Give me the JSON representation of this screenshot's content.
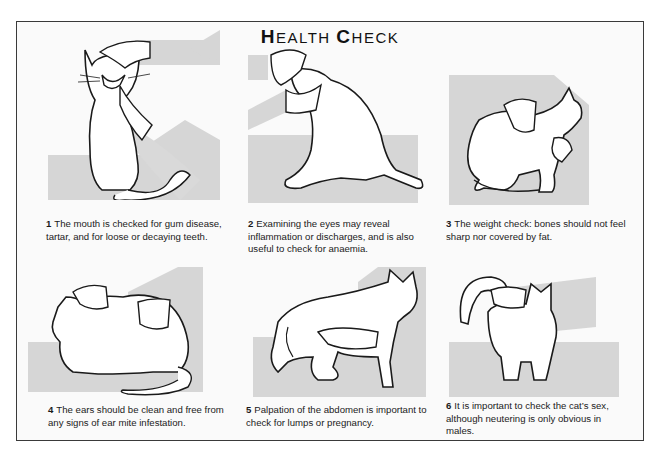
{
  "page": {
    "title": "HEALTH CHECK",
    "title_parts": {
      "h": "H",
      "ealth": "EALTH ",
      "c": "C",
      "heck": "HECK"
    },
    "accent_grey": "#d6d6d6",
    "line_color": "#1a1a1a"
  },
  "panels": [
    {
      "number": "1",
      "caption": "The mouth is checked for gum disease, tartar, and for loose or decaying teeth.",
      "illustration": "cat-sitting-mouth-open-hand-on-head"
    },
    {
      "number": "2",
      "caption": "Examining the eyes may reveal inflammation or discharges, and is also useful to check for anaemia.",
      "illustration": "cat-sitting-hand-holding-head"
    },
    {
      "number": "3",
      "caption": "The weight check: bones should not feel sharp nor covered by fat.",
      "illustration": "cat-crouching-hands-on-back-and-chest"
    },
    {
      "number": "4",
      "caption": "The ears should be clean and free from any signs of ear mite infestation.",
      "illustration": "cat-lying-hand-on-ear-and-back"
    },
    {
      "number": "5",
      "caption": "Palpation of the abdomen is important to check for lumps or pregnancy.",
      "illustration": "cat-standing-hand-under-belly"
    },
    {
      "number": "6",
      "caption": "It is important to check the cat’s sex, although neutering is only obvious in males.",
      "illustration": "cat-rear-view-hand-lifting-tail"
    }
  ]
}
